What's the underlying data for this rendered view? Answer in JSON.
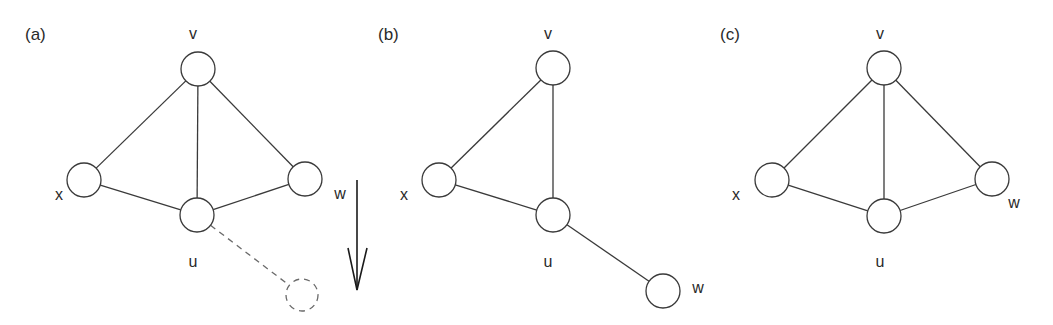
{
  "figure": {
    "colors": {
      "stroke": "#3a3a3a",
      "dashed_stroke": "#6a6a6a",
      "text": "#2a2a2a",
      "background": "#ffffff"
    },
    "node_radius": 17,
    "panels": [
      {
        "id": "a",
        "label": "(a)",
        "label_pos": [
          25,
          26
        ],
        "nodes": [
          {
            "id": "v",
            "label": "v",
            "cx": 198,
            "cy": 69,
            "label_x": 193,
            "label_y": 34
          },
          {
            "id": "x",
            "label": "x",
            "cx": 84,
            "cy": 180,
            "label_x": 59,
            "label_y": 195
          },
          {
            "id": "u",
            "label": "u",
            "cx": 197,
            "cy": 215,
            "label_x": 193,
            "label_y": 262
          },
          {
            "id": "w",
            "label": "w",
            "cx": 305,
            "cy": 179,
            "label_x": 340,
            "label_y": 194
          }
        ],
        "edges": [
          [
            "v",
            "x"
          ],
          [
            "v",
            "u"
          ],
          [
            "v",
            "w"
          ],
          [
            "x",
            "u"
          ],
          [
            "u",
            "w"
          ]
        ],
        "ghost_node": {
          "cx": 302,
          "cy": 295,
          "r": 16
        },
        "ghost_edge": {
          "from": "u",
          "to_x": 302,
          "to_y": 295
        },
        "arrow": {
          "x": 357,
          "y1": 180,
          "y2": 290,
          "direction": "down"
        }
      },
      {
        "id": "b",
        "label": "(b)",
        "label_pos": [
          378,
          26
        ],
        "nodes": [
          {
            "id": "v",
            "label": "v",
            "cx": 553,
            "cy": 68,
            "label_x": 548,
            "label_y": 34
          },
          {
            "id": "x",
            "label": "x",
            "cx": 439,
            "cy": 180,
            "label_x": 404,
            "label_y": 195
          },
          {
            "id": "u",
            "label": "u",
            "cx": 553,
            "cy": 215,
            "label_x": 548,
            "label_y": 262
          },
          {
            "id": "w",
            "label": "w",
            "cx": 663,
            "cy": 291,
            "label_x": 698,
            "label_y": 288
          }
        ],
        "edges": [
          [
            "v",
            "x"
          ],
          [
            "v",
            "u"
          ],
          [
            "x",
            "u"
          ],
          [
            "u",
            "w"
          ]
        ]
      },
      {
        "id": "c",
        "label": "(c)",
        "label_pos": [
          720,
          26
        ],
        "nodes": [
          {
            "id": "v",
            "label": "v",
            "cx": 884,
            "cy": 68,
            "label_x": 880,
            "label_y": 34
          },
          {
            "id": "x",
            "label": "x",
            "cx": 772,
            "cy": 180,
            "label_x": 736,
            "label_y": 195
          },
          {
            "id": "u",
            "label": "u",
            "cx": 884,
            "cy": 216,
            "label_x": 880,
            "label_y": 262
          },
          {
            "id": "w",
            "label": "w",
            "cx": 992,
            "cy": 179,
            "label_x": 1014,
            "label_y": 203
          }
        ],
        "edges": [
          [
            "v",
            "x"
          ],
          [
            "v",
            "u"
          ],
          [
            "v",
            "w"
          ],
          [
            "x",
            "u"
          ],
          [
            "u",
            "w"
          ]
        ]
      }
    ]
  }
}
